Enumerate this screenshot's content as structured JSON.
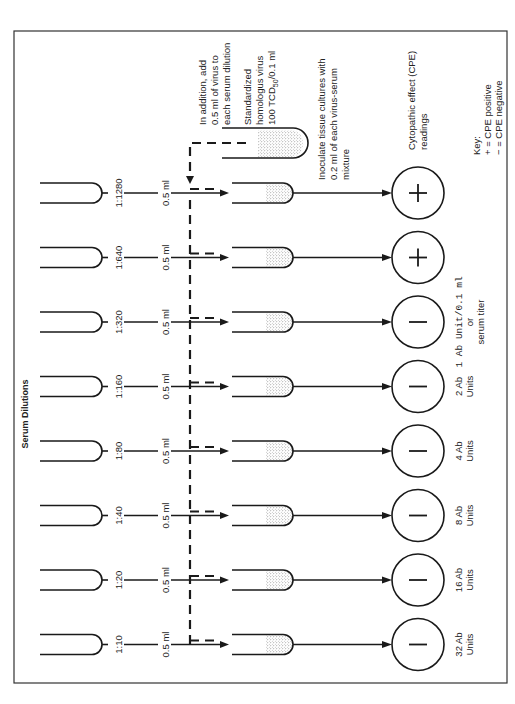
{
  "figure": {
    "orientation": "rotated 90 degrees counter-clockwise",
    "section_title": "Serum Dilutions",
    "virus_source": {
      "instruction": [
        "In addition, add",
        "0.5 ml of virus to",
        "each serum dilution"
      ],
      "label": [
        "Standardized",
        "homologus virus",
        "100 TCD",
        "50",
        "/0.1 ml"
      ]
    },
    "inoculate_note": [
      "Inoculate tissue cultures with",
      "0.2 ml of each virus-serum",
      "mixture"
    ],
    "cpe_heading": [
      "Cytopathic effect (CPE)",
      "readings"
    ],
    "key": {
      "title": "Key:",
      "positive": "+ = CPE positive",
      "negative": "− = CPE negative"
    },
    "transfer_volume": "0.5 ml",
    "rows": [
      {
        "dilution": "1:1280",
        "volume": "0.5 ml",
        "cpe": "+",
        "units": [
          "",
          ""
        ]
      },
      {
        "dilution": "1:640",
        "volume": "0.5 ml",
        "cpe": "+",
        "units": [
          "",
          ""
        ]
      },
      {
        "dilution": "1:320",
        "volume": "0.5 ml",
        "cpe": "−",
        "units": [
          "1 Ab Unit/0.1 ml",
          "or",
          "serum titer"
        ]
      },
      {
        "dilution": "1:160",
        "volume": "0.5 ml",
        "cpe": "−",
        "units": [
          "2 Ab",
          "Units"
        ]
      },
      {
        "dilution": "1:80",
        "volume": "0.5 ml",
        "cpe": "−",
        "units": [
          "4 Ab",
          "Units"
        ]
      },
      {
        "dilution": "1:40",
        "volume": "0.5 ml",
        "cpe": "−",
        "units": [
          "8 Ab",
          "Units"
        ]
      },
      {
        "dilution": "1:20",
        "volume": "0.5 ml",
        "cpe": "−",
        "units": [
          "16 Ab",
          "Units"
        ]
      },
      {
        "dilution": "1:10",
        "volume": "0.5 ml",
        "cpe": "−",
        "units": [
          "32 Ab",
          "Units"
        ]
      }
    ],
    "colors": {
      "ink": "#1a1a1a",
      "frame": "#333333",
      "background": "#ffffff"
    }
  }
}
